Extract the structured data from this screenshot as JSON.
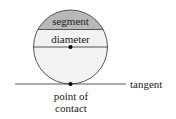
{
  "labels": {
    "segment": "segment",
    "diameter": "diameter",
    "tangent": "tangent",
    "point_line1": "point of",
    "point_line2": "contact"
  },
  "colors": {
    "segment_fill": "#b8b8b8",
    "circle_fill": "#f2f2f2",
    "stroke": "#444444"
  }
}
